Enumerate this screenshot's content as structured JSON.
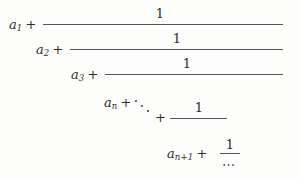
{
  "document": {
    "type": "math-expression",
    "name": "continued-fraction",
    "background_color": "#fdfdfb",
    "text_color": "#2e2e2e",
    "rule_color": "#55555a"
  },
  "expression": {
    "levels": [
      {
        "index": 1,
        "term_base": "a",
        "term_subscript": "1",
        "operator": "+",
        "numerator": "1"
      },
      {
        "index": 2,
        "term_base": "a",
        "term_subscript": "2",
        "operator": "+",
        "numerator": "1"
      },
      {
        "index": 3,
        "term_base": "a",
        "term_subscript": "3",
        "operator": "+",
        "numerator": "1"
      },
      {
        "index": 4,
        "term_base": "a",
        "term_subscript": "n",
        "operator": "+",
        "ellipsis": "⋱",
        "operator_after_ellipsis": "+",
        "numerator": "1"
      },
      {
        "index": 5,
        "term_base": "a",
        "term_subscript": "n+1",
        "operator": "+",
        "numerator": "1",
        "denominator_ellipsis": "⋯"
      }
    ]
  }
}
